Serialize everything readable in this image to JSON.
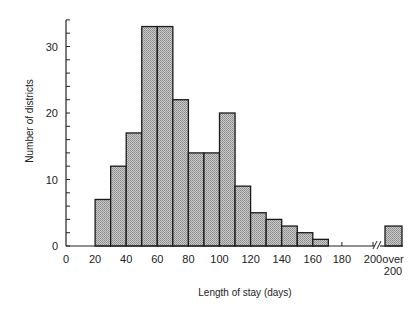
{
  "chart_data": {
    "type": "bar",
    "subtype": "histogram",
    "title": "",
    "xlabel": "Length of stay (days)",
    "ylabel": "Number of districts",
    "bins": [
      {
        "range": "20-30",
        "start": 20,
        "end": 30,
        "value": 7
      },
      {
        "range": "30-40",
        "start": 30,
        "end": 40,
        "value": 12
      },
      {
        "range": "40-50",
        "start": 40,
        "end": 50,
        "value": 17
      },
      {
        "range": "50-60",
        "start": 50,
        "end": 60,
        "value": 33
      },
      {
        "range": "60-70",
        "start": 60,
        "end": 70,
        "value": 33
      },
      {
        "range": "70-80",
        "start": 70,
        "end": 80,
        "value": 22
      },
      {
        "range": "80-90",
        "start": 80,
        "end": 90,
        "value": 14
      },
      {
        "range": "90-100",
        "start": 90,
        "end": 100,
        "value": 14
      },
      {
        "range": "100-110",
        "start": 100,
        "end": 110,
        "value": 20
      },
      {
        "range": "110-120",
        "start": 110,
        "end": 120,
        "value": 9
      },
      {
        "range": "120-130",
        "start": 120,
        "end": 130,
        "value": 5
      },
      {
        "range": "130-140",
        "start": 130,
        "end": 140,
        "value": 4
      },
      {
        "range": "140-150",
        "start": 140,
        "end": 150,
        "value": 3
      },
      {
        "range": "150-160",
        "start": 150,
        "end": 160,
        "value": 2
      },
      {
        "range": "160-170",
        "start": 160,
        "end": 170,
        "value": 1
      }
    ],
    "overflow_bin": {
      "label_line1": "over",
      "label_line2": "200",
      "value": 3
    },
    "categories": [
      "20-30",
      "30-40",
      "40-50",
      "50-60",
      "60-70",
      "70-80",
      "80-90",
      "90-100",
      "100-110",
      "110-120",
      "120-130",
      "130-140",
      "140-150",
      "150-160",
      "160-170",
      "over 200"
    ],
    "values": [
      7,
      12,
      17,
      33,
      33,
      22,
      14,
      14,
      20,
      9,
      5,
      4,
      3,
      2,
      1,
      3
    ],
    "x_ticks": [
      "0",
      "20",
      "40",
      "60",
      "80",
      "100",
      "120",
      "140",
      "160",
      "180",
      "200"
    ],
    "x_tick_values": [
      0,
      20,
      40,
      60,
      80,
      100,
      120,
      140,
      160,
      180,
      200
    ],
    "y_ticks": [
      "0",
      "10",
      "20",
      "30"
    ],
    "y_tick_values": [
      0,
      10,
      20,
      30
    ],
    "y_minor_tick_step": 2,
    "xlim": [
      0,
      200
    ],
    "ylim": [
      0,
      34
    ],
    "axis_break": "between 200 and over-200 bin",
    "grid": false,
    "legend": null,
    "bar_fill": "#b8b8b8",
    "bar_stroke": "#1a1a1a"
  }
}
